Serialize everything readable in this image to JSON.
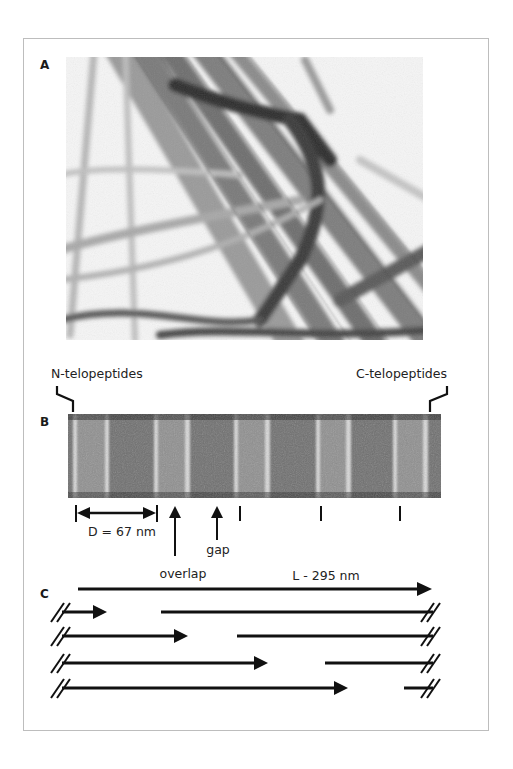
{
  "figure": {
    "panels": [
      {
        "id": "A",
        "label": "A",
        "content": "electron micrograph of collagen fibrils"
      },
      {
        "id": "B",
        "label": "B",
        "content": "banded single collagen fibril (D-periodicity)"
      },
      {
        "id": "C",
        "label": "C",
        "content": "quarter-staggered collagen molecule arrangement"
      }
    ],
    "panel_b": {
      "left_annotation": "N-telopeptides",
      "right_annotation": "C-telopeptides",
      "period_label": "D = 67 nm",
      "overlap_label": "overlap",
      "gap_label": "gap"
    },
    "panel_c": {
      "length_label": "L - 295 nm",
      "rows": [
        {
          "arrow_end_x": 107,
          "segment_start_x": 161
        },
        {
          "arrow_end_x": 188,
          "segment_start_x": 237
        },
        {
          "arrow_end_x": 268,
          "segment_start_x": 325
        },
        {
          "arrow_end_x": 348,
          "segment_start_x": 404
        }
      ]
    },
    "colors": {
      "ink": "#111111",
      "frame": "#bdbdbd",
      "micrograph_dark": "#2a2a2a",
      "micrograph_light": "#f4f4f4"
    }
  }
}
